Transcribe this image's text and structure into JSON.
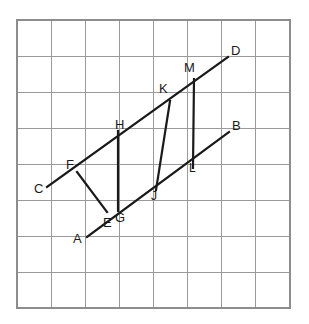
{
  "figure": {
    "background_color": "#ffffff",
    "line_color": "#1a1a1a",
    "grid_color": "#9a9a9a",
    "grid": {
      "left": 17,
      "top": 20,
      "right": 290,
      "bottom": 308,
      "columns": 8,
      "rows": 8,
      "cell_width": 34.1,
      "cell_height": 36
    },
    "points": [
      {
        "id": "A",
        "label": "A",
        "x": 87,
        "y": 237,
        "label_x": 73,
        "label_y": 232
      },
      {
        "id": "B",
        "label": "B",
        "x": 229,
        "y": 132,
        "label_x": 232,
        "label_y": 119
      },
      {
        "id": "C",
        "label": "C",
        "x": 47,
        "y": 187,
        "label_x": 34,
        "label_y": 182
      },
      {
        "id": "D",
        "label": "D",
        "x": 228,
        "y": 57,
        "label_x": 231,
        "label_y": 44
      },
      {
        "id": "E",
        "label": "E",
        "x": 107,
        "y": 212,
        "label_x": 103,
        "label_y": 216
      },
      {
        "id": "F",
        "label": "F",
        "x": 77,
        "y": 172,
        "label_x": 66,
        "label_y": 158
      },
      {
        "id": "G",
        "label": "G",
        "x": 118,
        "y": 211,
        "label_x": 115,
        "label_y": 211
      },
      {
        "id": "H",
        "label": "H",
        "x": 118,
        "y": 131,
        "label_x": 115,
        "label_y": 118
      },
      {
        "id": "J",
        "label": "J",
        "x": 156,
        "y": 190,
        "label_x": 151,
        "label_y": 190
      },
      {
        "id": "K",
        "label": "K",
        "x": 170,
        "y": 101,
        "label_x": 159,
        "label_y": 82
      },
      {
        "id": "L",
        "label": "L",
        "x": 193,
        "y": 168,
        "label_x": 189,
        "label_y": 162
      },
      {
        "id": "M",
        "label": "M",
        "x": 194,
        "y": 79,
        "label_x": 184,
        "label_y": 61
      }
    ],
    "segments": [
      {
        "name": "line-C-D",
        "from": "C",
        "to": "D"
      },
      {
        "name": "line-A-B",
        "from": "A",
        "to": "B"
      },
      {
        "name": "segment-F-E",
        "from": "F",
        "to": "E"
      },
      {
        "name": "segment-H-G",
        "from": "H",
        "to": "G"
      },
      {
        "name": "segment-K-J",
        "from": "K",
        "to": "J"
      },
      {
        "name": "segment-M-L",
        "from": "M",
        "to": "L"
      }
    ]
  }
}
